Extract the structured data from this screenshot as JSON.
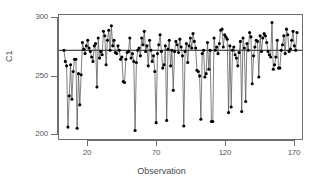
{
  "chart_data": {
    "type": "line",
    "title": "",
    "subtitle": "",
    "xlabel": "Observation",
    "ylabel": "C1",
    "xlim": [
      1,
      178
    ],
    "ylim": [
      195,
      301
    ],
    "xticks": [
      20,
      70,
      120,
      170
    ],
    "yticks": [
      200,
      250,
      300
    ],
    "grid": false,
    "legend": null,
    "marker": "filled-circle",
    "line_color": "#555555",
    "marker_color": "#000000",
    "reference_line": {
      "orientation": "horizontal",
      "value": 272,
      "color": "#000000",
      "label": ""
    },
    "series": [
      {
        "name": "C1",
        "x": [
          1,
          2,
          3,
          4,
          5,
          6,
          7,
          8,
          9,
          10,
          11,
          12,
          13,
          14,
          15,
          16,
          17,
          18,
          19,
          20,
          21,
          22,
          23,
          24,
          25,
          26,
          27,
          28,
          29,
          30,
          31,
          32,
          33,
          34,
          35,
          36,
          37,
          38,
          39,
          40,
          41,
          42,
          43,
          44,
          45,
          46,
          47,
          48,
          49,
          50,
          51,
          52,
          53,
          54,
          55,
          56,
          57,
          58,
          59,
          60,
          61,
          62,
          63,
          64,
          65,
          66,
          67,
          68,
          69,
          70,
          71,
          72,
          73,
          74,
          75,
          76,
          77,
          78,
          79,
          80,
          81,
          82,
          83,
          84,
          85,
          86,
          87,
          88,
          89,
          90,
          91,
          92,
          93,
          94,
          95,
          96,
          97,
          98,
          99,
          100,
          101,
          102,
          103,
          104,
          105,
          106,
          107,
          108,
          109,
          110,
          111,
          112,
          113,
          114,
          115,
          116,
          117,
          118,
          119,
          120,
          121,
          122,
          123,
          124,
          125,
          126,
          127,
          128,
          129,
          130,
          131,
          132,
          133,
          134,
          135,
          136,
          137,
          138,
          139,
          140,
          141,
          142,
          143,
          144,
          145,
          146,
          147,
          148,
          149,
          150,
          151,
          152,
          153,
          154,
          155,
          156,
          157,
          158,
          159,
          160,
          161,
          162,
          163,
          164,
          165,
          166,
          167,
          168,
          169,
          170,
          171,
          172,
          173,
          174,
          175,
          176,
          177,
          178
        ],
        "values": [
          272,
          262,
          258,
          203,
          231,
          259,
          228,
          253,
          264,
          264,
          202,
          251,
          223,
          250,
          279,
          273,
          269,
          276,
          281,
          274,
          271,
          266,
          262,
          276,
          278,
          239,
          283,
          265,
          271,
          268,
          289,
          285,
          259,
          281,
          290,
          272,
          294,
          276,
          281,
          270,
          269,
          276,
          272,
          264,
          266,
          244,
          243,
          264,
          270,
          271,
          283,
          265,
          269,
          262,
          200,
          261,
          272,
          274,
          267,
          283,
          277,
          289,
          271,
          276,
          258,
          281,
          272,
          262,
          267,
          253,
          207,
          269,
          277,
          286,
          271,
          256,
          259,
          276,
          209,
          273,
          281,
          258,
          272,
          236,
          271,
          280,
          277,
          270,
          282,
          275,
          267,
          204,
          271,
          278,
          261,
          276,
          283,
          274,
          287,
          280,
          274,
          254,
          253,
          249,
          210,
          269,
          272,
          248,
          251,
          279,
          255,
          272,
          208,
          208,
          283,
          272,
          275,
          269,
          278,
          290,
          291,
          275,
          286,
          284,
          282,
          216,
          276,
          221,
          272,
          275,
          268,
          265,
          258,
          270,
          280,
          217,
          283,
          274,
          226,
          278,
          272,
          288,
          284,
          242,
          267,
          275,
          281,
          280,
          248,
          285,
          271,
          283,
          287,
          285,
          279,
          271,
          268,
          266,
          297,
          255,
          259,
          266,
          281,
          256,
          256,
          272,
          277,
          285,
          269,
          291,
          286,
          271,
          273,
          281,
          289,
          276,
          272,
          288
        ]
      }
    ]
  },
  "axis": {
    "y_tick_labels": [
      "300",
      "250",
      "200"
    ],
    "x_tick_labels": [
      "20",
      "70",
      "120",
      "170"
    ],
    "y_title": "C1",
    "x_title": "Observation"
  },
  "style": {
    "background": "#ffffff",
    "frame_color": "#6e6e6e",
    "text_color": "#58585a"
  }
}
